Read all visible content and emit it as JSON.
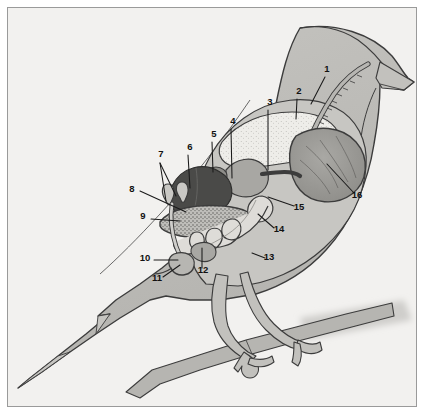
{
  "figure": {
    "frame_border_color": "#9a9a9a",
    "background_color": "#f2f1ef"
  },
  "palette": {
    "paper": "#f2f1ef",
    "body_fill": "#b9b8b4",
    "body_fill_light": "#cfcecb",
    "outline": "#3c3c3c",
    "cavity_fill": "#c7c6c2",
    "crop_fill": "#eeede9",
    "liver_dark": "#4a4a48",
    "gizzard_fill": "#9d9c98",
    "organ_mid": "#8e8d89",
    "intestine_fill": "#dedcd8",
    "branch_fill": "#b6b5b1",
    "shadow_fill": "#c9c8c4",
    "label_text": "#111111",
    "leader_line": "#1a1a1a"
  },
  "callouts": [
    {
      "id": "1",
      "label": "1",
      "x": 327,
      "y": 72,
      "anchor": "middle",
      "organ": "esophagus-trachea"
    },
    {
      "id": "2",
      "label": "2",
      "x": 299,
      "y": 94,
      "anchor": "middle",
      "organ": "crop"
    },
    {
      "id": "3",
      "label": "3",
      "x": 270,
      "y": 105,
      "anchor": "middle",
      "organ": "crop-lower-wall"
    },
    {
      "id": "4",
      "label": "4",
      "x": 233,
      "y": 124,
      "anchor": "middle",
      "organ": "proventriculus"
    },
    {
      "id": "5",
      "label": "5",
      "x": 214,
      "y": 137,
      "anchor": "middle",
      "organ": "spleen"
    },
    {
      "id": "6",
      "label": "6",
      "x": 190,
      "y": 150,
      "anchor": "middle",
      "organ": "liver"
    },
    {
      "id": "7",
      "label": "7",
      "x": 161,
      "y": 157,
      "anchor": "middle",
      "organ": "caeca"
    },
    {
      "id": "8",
      "label": "8",
      "x": 132,
      "y": 192,
      "anchor": "middle",
      "organ": "rectum"
    },
    {
      "id": "9",
      "label": "9",
      "x": 143,
      "y": 219,
      "anchor": "middle",
      "organ": "ileum"
    },
    {
      "id": "10",
      "label": "10",
      "x": 145,
      "y": 261,
      "anchor": "middle",
      "organ": "cloaca"
    },
    {
      "id": "11",
      "label": "11",
      "x": 157,
      "y": 281,
      "anchor": "middle",
      "organ": "vent"
    },
    {
      "id": "12",
      "label": "12",
      "x": 203,
      "y": 273,
      "anchor": "middle",
      "organ": "pancreas"
    },
    {
      "id": "13",
      "label": "13",
      "x": 269,
      "y": 260,
      "anchor": "middle",
      "organ": "duodenum"
    },
    {
      "id": "14",
      "label": "14",
      "x": 279,
      "y": 232,
      "anchor": "middle",
      "organ": "jejunum"
    },
    {
      "id": "15",
      "label": "15",
      "x": 299,
      "y": 210,
      "anchor": "middle",
      "organ": "bile-duct"
    },
    {
      "id": "16",
      "label": "16",
      "x": 357,
      "y": 198,
      "anchor": "middle",
      "organ": "gizzard"
    }
  ],
  "leader_lines": [
    {
      "for": "1",
      "points": "325,77 311,104"
    },
    {
      "for": "2",
      "points": "297,99 296,119"
    },
    {
      "for": "3",
      "points": "268,110 268,170"
    },
    {
      "for": "4",
      "points": "231,129 232,178"
    },
    {
      "for": "5",
      "points": "212,142 213,172"
    },
    {
      "for": "6",
      "points": "188,155 190,188"
    },
    {
      "for": "7a",
      "points": "160,163 166,201"
    },
    {
      "for": "7b",
      "points": "160,163 176,196"
    },
    {
      "for": "8",
      "points": "140,191 186,212"
    },
    {
      "for": "9",
      "points": "151,219 180,221"
    },
    {
      "for": "10",
      "points": "154,260 178,260"
    },
    {
      "for": "11",
      "points": "163,277 180,265"
    },
    {
      "for": "12",
      "points": "202,268 202,248"
    },
    {
      "for": "13",
      "points": "265,258 252,253"
    },
    {
      "for": "14",
      "points": "274,228 258,214"
    },
    {
      "for": "15",
      "points": "294,206 268,197"
    },
    {
      "for": "16",
      "points": "354,193 327,164"
    }
  ]
}
